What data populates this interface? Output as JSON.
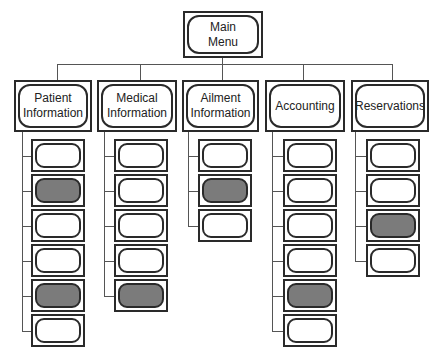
{
  "diagram": {
    "type": "hierarchy-menu",
    "root": {
      "label": "Main Menu",
      "label_lines": [
        "Main",
        "Menu"
      ]
    },
    "categories": [
      {
        "id": "patient",
        "label": "Patient Information",
        "label_html_lines": [
          "Patient",
          "Information"
        ],
        "children": [
          {
            "shaded": false
          },
          {
            "shaded": true
          },
          {
            "shaded": false
          },
          {
            "shaded": false
          },
          {
            "shaded": true
          },
          {
            "shaded": false
          }
        ]
      },
      {
        "id": "medical",
        "label": "Medical Information",
        "label_html_lines": [
          "Medical",
          "Information"
        ],
        "children": [
          {
            "shaded": false
          },
          {
            "shaded": false
          },
          {
            "shaded": false
          },
          {
            "shaded": false
          },
          {
            "shaded": true
          }
        ]
      },
      {
        "id": "ailment",
        "label": "Ailment Information",
        "label_html_lines": [
          "Ailment",
          "Information"
        ],
        "children": [
          {
            "shaded": false
          },
          {
            "shaded": true
          },
          {
            "shaded": false
          }
        ]
      },
      {
        "id": "accounting",
        "label": "Accounting",
        "label_html_lines": [
          "Accounting"
        ],
        "children": [
          {
            "shaded": false
          },
          {
            "shaded": false
          },
          {
            "shaded": false
          },
          {
            "shaded": false
          },
          {
            "shaded": true
          },
          {
            "shaded": false
          }
        ]
      },
      {
        "id": "reservations",
        "label": "Reservations",
        "label_html_lines": [
          "Reservations"
        ],
        "children": [
          {
            "shaded": false
          },
          {
            "shaded": false
          },
          {
            "shaded": true
          },
          {
            "shaded": false
          }
        ]
      }
    ],
    "colors": {
      "stroke": "#2a2a2a",
      "shaded_fill": "#7b7b7b",
      "background": "#ffffff",
      "connector": "#555555"
    }
  }
}
